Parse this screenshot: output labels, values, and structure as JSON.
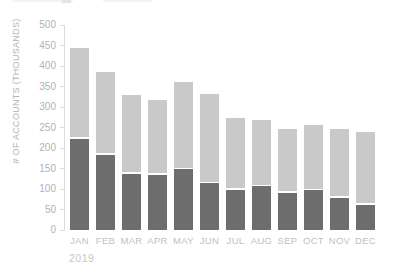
{
  "colors": {
    "background": "#ffffff",
    "bar_dark": "#6d6d6d",
    "bar_light": "#c9c9c9",
    "axis_line": "#dcdcdc",
    "tick_text": "#b3b3b3",
    "month_text": "#bfbfbf",
    "year_text": "#c6c6c6",
    "ylabel_text": "#b3b3b3",
    "top_artifact": "#f3f3f3",
    "top_artifact_dark": "#e4e4e4"
  },
  "chart_data": {
    "type": "bar",
    "stacked": true,
    "title": "",
    "xlabel": "2019",
    "ylabel": "# OF ACCOUNTS (THOUSANDS)",
    "categories": [
      "JAN",
      "FEB",
      "MAR",
      "APR",
      "MAY",
      "JUN",
      "JUL",
      "AUG",
      "SEP",
      "OCT",
      "NOV",
      "DEC"
    ],
    "series": [
      {
        "name": "dark-bottom-segment",
        "color": "#6d6d6d",
        "values": [
          222,
          184,
          137,
          134,
          148,
          114,
          98,
          107,
          90,
          97,
          78,
          62
        ]
      },
      {
        "name": "light-top-segment",
        "color": "#c9c9c9",
        "values": [
          223,
          202,
          192,
          184,
          214,
          217,
          175,
          161,
          156,
          158,
          169,
          176
        ]
      }
    ],
    "stacked_totals": [
      445,
      386,
      329,
      318,
      362,
      331,
      273,
      268,
      246,
      255,
      247,
      238
    ],
    "ylim": [
      0,
      500
    ],
    "yticks": [
      0,
      50,
      100,
      150,
      200,
      250,
      300,
      350,
      400,
      450,
      500
    ],
    "grid": false,
    "legend": "not visible (cropped at top edge)"
  }
}
